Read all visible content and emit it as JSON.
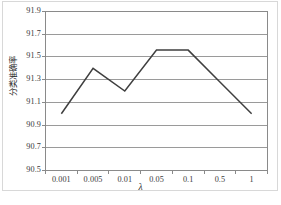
{
  "chart_data": {
    "type": "line",
    "title": "",
    "xlabel": "λ",
    "ylabel": "分类准确率",
    "categories": [
      "0.001",
      "0.005",
      "0.01",
      "0.05",
      "0.1",
      "0.5",
      "1"
    ],
    "values": [
      91.0,
      91.4,
      91.2,
      91.56,
      91.56,
      91.28,
      91.0
    ],
    "series": [
      {
        "name": "分类准确率",
        "values": [
          91.0,
          91.4,
          91.2,
          91.56,
          91.56,
          91.28,
          91.0
        ]
      }
    ],
    "ylim": [
      90.5,
      91.9
    ],
    "yticks": [
      "90.5",
      "90.7",
      "90.9",
      "91.1",
      "91.3",
      "91.5",
      "91.7",
      "91.9"
    ],
    "ytick_values": [
      90.5,
      90.7,
      90.9,
      91.1,
      91.3,
      91.5,
      91.7,
      91.9
    ],
    "grid": true,
    "grid_axis": "y",
    "legend": false,
    "legend_position": "none",
    "markers": false,
    "line_color": "#3f3f3f",
    "grid_color": "#9a9a9a",
    "axis_color": "#8a8a8a",
    "background_color": "#ffffff",
    "frame_color": "#d8d8d8"
  }
}
